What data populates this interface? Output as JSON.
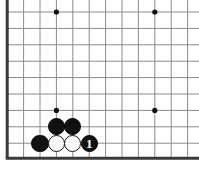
{
  "diagram": {
    "board_color": "#ffffff",
    "line_color": "#8a8a8a",
    "border_color": "#3a3a3a",
    "star_color": "#111111",
    "black_stone_color": "#111111",
    "white_stone_color": "#ffffff",
    "stone_outline_color": "#141414",
    "geometry": {
      "origin_x": 7.2,
      "origin_y": 12.0,
      "spacing": 16.4,
      "cols": 12,
      "rows": 10,
      "border_left_x": 7.2,
      "border_bottom_y": 158.3,
      "border_thickness": 3
    },
    "star_points": [
      {
        "col": 3,
        "row": 0
      },
      {
        "col": 9,
        "row": 0
      },
      {
        "col": 3,
        "row": 6
      },
      {
        "col": 9,
        "row": 6
      }
    ],
    "stones": [
      {
        "id": "b1",
        "color": "black",
        "col": 3,
        "row": 7,
        "label": ""
      },
      {
        "id": "b2",
        "color": "black",
        "col": 4,
        "row": 7,
        "label": ""
      },
      {
        "id": "b3",
        "color": "black",
        "col": 2,
        "row": 8,
        "label": ""
      },
      {
        "id": "w1",
        "color": "white",
        "col": 3,
        "row": 8,
        "label": ""
      },
      {
        "id": "w2",
        "color": "white",
        "col": 4,
        "row": 8,
        "label": ""
      },
      {
        "id": "b4",
        "color": "black",
        "col": 5,
        "row": 8,
        "label": "1"
      }
    ],
    "move_numbers": [
      {
        "number": "1",
        "color": "black",
        "col": 5,
        "row": 8
      }
    ],
    "stone_diameter": 17.4
  }
}
